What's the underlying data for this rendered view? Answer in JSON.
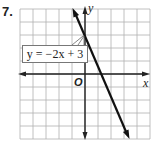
{
  "problem": {
    "number": "7."
  },
  "chart_data": {
    "type": "line",
    "title": "",
    "xlabel": "x",
    "ylabel": "y",
    "origin_label": "O",
    "grid": true,
    "xlim": [
      -5,
      5
    ],
    "ylim": [
      -5,
      5
    ],
    "series": [
      {
        "name": "y = −2x + 3",
        "equation": "y = -2x + 3",
        "slope": -2,
        "intercept": 3,
        "points": [
          [
            -1,
            5
          ],
          [
            0,
            3
          ],
          [
            1.5,
            0
          ],
          [
            4,
            -5
          ]
        ]
      }
    ],
    "annotations": [
      {
        "text": "y = −2x + 3",
        "points_to": [
          0,
          3
        ]
      }
    ]
  },
  "labels": {
    "equation": "y = −2x + 3",
    "x_axis": "x",
    "y_axis": "y",
    "origin": "O"
  },
  "colors": {
    "grid": "#b0b0b0",
    "axis": "#222222",
    "line": "#111111"
  }
}
